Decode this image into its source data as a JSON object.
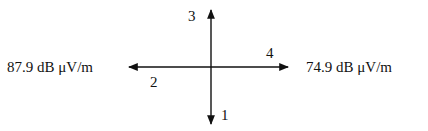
{
  "diagram": {
    "left_value": "87.9 dB μV/m",
    "right_value": "74.9 dB μV/m",
    "arrows": [
      {
        "id": "1",
        "label": "1",
        "direction": "down"
      },
      {
        "id": "2",
        "label": "2",
        "direction": "left"
      },
      {
        "id": "3",
        "label": "3",
        "direction": "up"
      },
      {
        "id": "4",
        "label": "4",
        "direction": "right"
      }
    ],
    "colors": {
      "line": "#111111",
      "background": "#ffffff"
    }
  }
}
